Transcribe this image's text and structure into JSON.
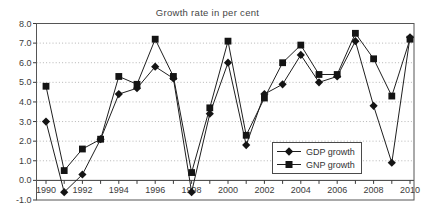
{
  "chart_data": {
    "type": "line",
    "title": "Growth rate in per cent",
    "x": [
      1990,
      1991,
      1992,
      1993,
      1994,
      1995,
      1996,
      1997,
      1998,
      1999,
      2000,
      2001,
      2002,
      2003,
      2004,
      2005,
      2006,
      2007,
      2008,
      2009,
      2010
    ],
    "x_tick_labels": [
      "1990",
      "1992",
      "1994",
      "1996",
      "1998",
      "2000",
      "2002",
      "2004",
      "2006",
      "2008",
      "2010"
    ],
    "y_tick_labels": [
      "-1.0",
      "0.0",
      "1.0",
      "2.0",
      "3.0",
      "4.0",
      "5.0",
      "6.0",
      "7.0",
      "8.0"
    ],
    "ylim": [
      -1.0,
      8.0
    ],
    "grid": "horizontal-dotted",
    "legend_position": "inside-lower-right",
    "series": [
      {
        "name": "GDP growth",
        "marker": "diamond",
        "values": [
          3.0,
          -0.6,
          0.3,
          2.1,
          4.4,
          4.7,
          5.8,
          5.2,
          -0.6,
          3.4,
          6.0,
          1.8,
          4.4,
          4.9,
          6.4,
          5.0,
          5.3,
          7.1,
          3.8,
          0.9,
          7.3
        ]
      },
      {
        "name": "GNP growth",
        "marker": "square",
        "values": [
          4.8,
          0.5,
          1.6,
          2.1,
          5.3,
          4.9,
          7.2,
          5.3,
          0.4,
          3.7,
          7.1,
          2.3,
          4.2,
          6.0,
          6.9,
          5.4,
          5.4,
          7.5,
          6.2,
          4.3,
          7.2
        ]
      }
    ],
    "colors": {
      "series": "#1f1f1f",
      "marker": "#141414",
      "grid": "#b5b5b5",
      "axis": "#3a3a3a",
      "border": "#555555",
      "text": "#3b3b3b",
      "background": "#ffffff"
    }
  }
}
